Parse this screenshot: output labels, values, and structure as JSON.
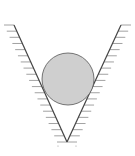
{
  "diagram": {
    "colors": {
      "background": "#ffffff",
      "wall_line": "#444444",
      "hatch": "#8a8a8a",
      "ball_fill": "#cfcfcf",
      "ball_stroke": "#555555"
    },
    "left_wall": {
      "x1": 14,
      "y1": 25,
      "x2": 67,
      "y2": 142
    },
    "right_wall": {
      "x1": 121,
      "y1": 25,
      "x2": 67,
      "y2": 142
    },
    "ball": {
      "cx": 68,
      "cy": 79,
      "r": 26
    },
    "hatch": {
      "count": 19,
      "length": 10
    }
  }
}
